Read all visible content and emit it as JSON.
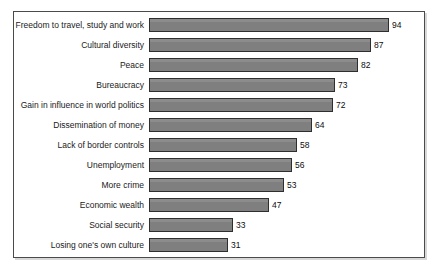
{
  "chart_data": {
    "type": "bar",
    "orientation": "horizontal",
    "title": "",
    "subtitle": "",
    "xlabel": "",
    "ylabel": "",
    "grid": false,
    "legend": null,
    "legend_position": "none",
    "xlim": [
      0,
      100
    ],
    "axis_ticks_visible": false,
    "value_labels_shown": true,
    "bar_color": "#7f7f7f",
    "bar_border_color": "#2e2e2e",
    "panel_border_color": "#4a4a4a",
    "background_color": "#ffffff",
    "categories": [
      "Freedom to travel, study and work",
      "Cultural diversity",
      "Peace",
      "Bureaucracy",
      "Gain in influence in world politics",
      "Dissemination of money",
      "Lack of border controls",
      "Unemployment",
      "More crime",
      "Economic wealth",
      "Social security",
      "Losing one's own culture"
    ],
    "values": [
      94,
      87,
      82,
      73,
      72,
      64,
      58,
      56,
      53,
      47,
      33,
      31
    ]
  }
}
